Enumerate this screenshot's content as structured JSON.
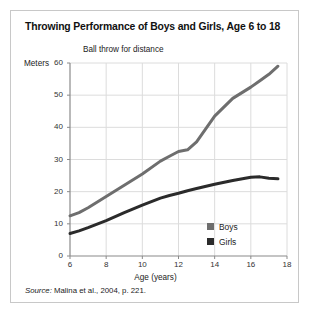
{
  "card": {
    "title": "Throwing Performance of Boys and Girls, Age 6 to 18",
    "source_label": "Source:",
    "source_text": " Malina et al., 2004, p. 221."
  },
  "colors": {
    "boys": "#6e6e6e",
    "girls": "#2b2b2b",
    "grid": "#dcdcdc",
    "axis": "#8a8a8a",
    "border": "#c8c8c8",
    "text": "#1a1a1a"
  },
  "chart_data": {
    "type": "line",
    "title": "Throwing Performance of Boys and Girls, Age 6 to 18",
    "subtitle": "Ball throw for distance",
    "xlabel": "Age (years)",
    "ylabel": "Meters",
    "xlim": [
      6,
      18
    ],
    "ylim": [
      0,
      60
    ],
    "xticks": [
      6,
      8,
      10,
      12,
      14,
      16,
      18
    ],
    "yticks": [
      0,
      10,
      20,
      30,
      40,
      50,
      60
    ],
    "grid": true,
    "legend_position": "bottom-right",
    "x": [
      6,
      6.5,
      7,
      8,
      9,
      10,
      11,
      11.5,
      12,
      12.5,
      13,
      14,
      15,
      16,
      16.5,
      17,
      17.5
    ],
    "series": [
      {
        "name": "Boys",
        "color": "#6e6e6e",
        "values": [
          12.5,
          13.5,
          15.0,
          18.5,
          22.0,
          25.5,
          29.5,
          31.0,
          32.5,
          33.0,
          35.5,
          43.5,
          49.0,
          52.5,
          54.5,
          56.5,
          59.0
        ]
      },
      {
        "name": "Girls",
        "color": "#2b2b2b",
        "values": [
          7.0,
          7.8,
          8.8,
          11.0,
          13.5,
          15.8,
          18.0,
          18.8,
          19.5,
          20.3,
          21.0,
          22.3,
          23.5,
          24.5,
          24.6,
          24.2,
          24.0
        ]
      }
    ]
  }
}
